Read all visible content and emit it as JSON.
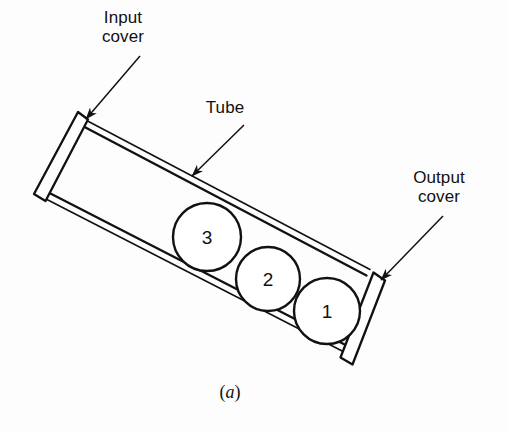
{
  "figure": {
    "caption": "(a)",
    "caption_open_paren": "(",
    "caption_letter": "a",
    "caption_close_paren": ")",
    "background_color": "#fdfdfd",
    "line_color": "#111111"
  },
  "labels": {
    "input_cover": {
      "line1": "Input",
      "line2": "cover",
      "name": "input-cover-label"
    },
    "tube": {
      "line1": "Tube",
      "name": "tube-label"
    },
    "output_cover": {
      "line1": "Output",
      "line2": "cover",
      "name": "output-cover-label"
    }
  },
  "diagram": {
    "type": "schematic",
    "tube": {
      "angle_deg": 38,
      "outline": "parallelogram"
    },
    "balls": [
      {
        "label": "3",
        "cx": 207,
        "cy": 237,
        "r": 34
      },
      {
        "label": "2",
        "cx": 268,
        "cy": 279,
        "r": 32
      },
      {
        "label": "1",
        "cx": 327,
        "cy": 311,
        "r": 33
      }
    ],
    "covers": [
      {
        "name": "input-cover",
        "position": "upper-left"
      },
      {
        "name": "output-cover",
        "position": "lower-right"
      }
    ],
    "arrows": [
      {
        "name": "input-cover-arrow",
        "from": [
          140,
          58
        ],
        "to": [
          84,
          120
        ]
      },
      {
        "name": "tube-arrow",
        "from": [
          243,
          126
        ],
        "to": [
          190,
          178
        ]
      },
      {
        "name": "output-cover-arrow",
        "from": [
          442,
          218
        ],
        "to": [
          379,
          281
        ]
      }
    ]
  }
}
